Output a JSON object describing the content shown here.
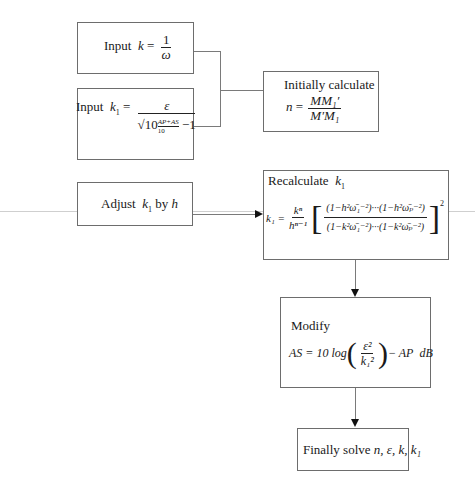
{
  "nodes": {
    "input_k": {
      "label": "Input",
      "lhs": "k",
      "eq": "=",
      "num": "1",
      "den": "ω"
    },
    "input_k1": {
      "label": "Input",
      "lhs": "k",
      "lhs_sub": "1",
      "eq": "=",
      "num": "ε",
      "den_base": "10",
      "den_exp": "AP+AS / 10",
      "den_exp_num": "AP+AS",
      "den_exp_den": "10",
      "den_tail": "−1"
    },
    "initial": {
      "title": "Initially calculate",
      "lhs": "n",
      "eq": "=",
      "num": "MM₁′",
      "den": "M′M₁"
    },
    "adjust": {
      "label": "Adjust",
      "var": "k",
      "var_sub": "1",
      "by": "by",
      "h": "h"
    },
    "recalc": {
      "title": "Recalculate",
      "title_var": "k",
      "title_var_sub": "1",
      "lhs": "k₁ =",
      "coef_num": "kⁿ",
      "coef_den": "hⁿ⁻¹",
      "num": "(1−h²ω̄₁⁻²)···(1−h²ω̄ₚ⁻²)",
      "den": "(1−k²ω̄₁⁻²)···(1−k²ω̄ₚ⁻²)",
      "power": "2"
    },
    "modify": {
      "title": "Modify",
      "lhs": "AS = 10 log",
      "frac_num": "ε²",
      "frac_den": "k₁²",
      "tail": "− AP",
      "unit": "dB"
    },
    "final": {
      "label": "Finally solve",
      "vars": "n, ε, k, k₁"
    }
  },
  "edges": [
    {
      "from": "input_k",
      "to": "initial",
      "type": "bracket"
    },
    {
      "from": "input_k1",
      "to": "initial",
      "type": "bracket"
    },
    {
      "from": "adjust",
      "to": "recalc",
      "type": "arrow"
    },
    {
      "from": "recalc",
      "to": "modify",
      "type": "arrow"
    },
    {
      "from": "modify",
      "to": "final",
      "type": "arrow"
    }
  ],
  "colors": {
    "border": "#6d6d6d",
    "line": "#7a7a7a",
    "text": "#1a1a1a"
  }
}
